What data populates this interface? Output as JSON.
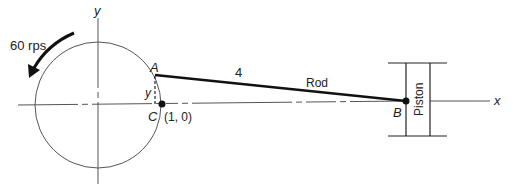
{
  "diagram": {
    "type": "crank-rod-piston mechanism",
    "labels": {
      "rotation": "60 rps",
      "point_a": "A",
      "point_b": "B",
      "point_c": "C",
      "point_c_coord": "(1, 0)",
      "y_segment": "y",
      "rod_length": "4",
      "rod": "Rod",
      "piston": "Piston",
      "x_axis": "x",
      "y_axis": "y"
    },
    "colors": {
      "line": "#222222",
      "thin_line": "#555555",
      "background": "#ffffff"
    }
  }
}
